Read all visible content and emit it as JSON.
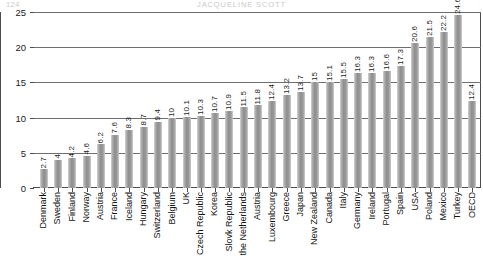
{
  "running_head": {
    "folio": "124",
    "author": "JACQUELINE SCOTT"
  },
  "chart_data": {
    "type": "bar",
    "title": "",
    "xlabel": "",
    "ylabel": "",
    "ylim": [
      0,
      25
    ],
    "yticks": [
      0,
      5,
      10,
      15,
      20,
      25
    ],
    "grid": true,
    "legend": false,
    "orientation": "vertical",
    "value_labels": true,
    "bar_color": "#999999",
    "categories": [
      "Denmark",
      "Sweden",
      "Finland",
      "Norway",
      "Austria",
      "France",
      "Iceland",
      "Hungary",
      "Switzerland",
      "Belgium",
      "UK",
      "Czech Republic",
      "Korea",
      "Slovk Republic",
      "the Netherlands",
      "Austria",
      "Luxembourg",
      "Greece",
      "Japan",
      "New Zealand",
      "Canada",
      "Italy",
      "Germany",
      "Ireland",
      "Portugal",
      "Spain",
      "USA",
      "Poland",
      "Mexico",
      "Turkey",
      "OECD"
    ],
    "values": [
      2.7,
      4,
      4.2,
      4.6,
      6.2,
      7.6,
      8.3,
      8.7,
      9.4,
      10,
      10.1,
      10.3,
      10.7,
      10.9,
      11.5,
      11.8,
      12.4,
      13.2,
      13.7,
      15,
      15.1,
      15.5,
      16.3,
      16.3,
      16.6,
      17.3,
      20.6,
      21.5,
      22.2,
      24.6,
      12.4
    ],
    "value_label_text": [
      "2.7",
      "4",
      "4.2",
      "4.6",
      "6.2",
      "7.6",
      "8.3",
      "8.7",
      "9.4",
      "10",
      "10.1",
      "10.3",
      "10.7",
      "10.9",
      "11.5",
      "11.8",
      "12.4",
      "13.2",
      "13.7",
      "15",
      "15.1",
      "15.5",
      "16.3",
      "16.3",
      "16.6",
      "17.3",
      "20.6",
      "21.5",
      "22.2",
      "24.6",
      "12.4"
    ],
    "ytick_labels": [
      "0",
      "5",
      "10",
      "15",
      "20",
      "25"
    ]
  }
}
